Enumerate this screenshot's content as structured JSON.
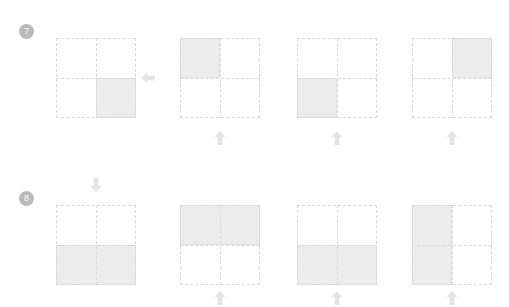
{
  "page": {
    "width": 509,
    "height": 307,
    "background": "#ffffff",
    "grid_line_color": "#d8d8d8",
    "fill_color": "#ececec",
    "arrow_color": "#e4e4e4",
    "badge_color": "#b9b9b9",
    "badge_text_color": "#ffffff"
  },
  "questions": [
    {
      "number": "7",
      "badge": {
        "label": "7",
        "x": 19,
        "y": 24
      },
      "prompt_grid": {
        "name": "question-7-prompt-grid",
        "x": 56,
        "y": 38,
        "size": 80,
        "rows": 2,
        "cols": 2,
        "shaded": [
          "bottom-right"
        ]
      },
      "prompt_arrow": {
        "name": "question-7-prompt-arrow",
        "direction": "left",
        "x": 139,
        "y": 69
      },
      "options": [
        {
          "label": "A",
          "grid": {
            "x": 180,
            "y": 38,
            "size": 80,
            "shaded": [
              "top-left"
            ]
          },
          "arrow": {
            "direction": "up",
            "x": 211,
            "y": 129
          }
        },
        {
          "label": "B",
          "grid": {
            "x": 297,
            "y": 38,
            "size": 80,
            "shaded": [
              "bottom-left"
            ]
          },
          "arrow": {
            "direction": "up",
            "x": 328,
            "y": 129
          }
        },
        {
          "label": "C",
          "grid": {
            "x": 412,
            "y": 38,
            "size": 80,
            "shaded": [
              "top-right"
            ]
          },
          "arrow": {
            "direction": "up",
            "x": 443,
            "y": 129
          }
        }
      ]
    },
    {
      "number": "8",
      "badge": {
        "label": "8",
        "x": 19,
        "y": 191
      },
      "prompt_grid": {
        "name": "question-8-prompt-grid",
        "x": 56,
        "y": 205,
        "size": 80,
        "rows": 2,
        "cols": 2,
        "shaded": [
          "bottom-half"
        ]
      },
      "prompt_arrow": {
        "name": "question-8-prompt-arrow",
        "direction": "down",
        "x": 87,
        "y": 176
      },
      "options": [
        {
          "label": "A",
          "grid": {
            "x": 180,
            "y": 205,
            "size": 80,
            "shaded": [
              "top-half"
            ]
          },
          "arrow": {
            "direction": "up",
            "x": 211,
            "y": 289
          }
        },
        {
          "label": "B",
          "grid": {
            "x": 297,
            "y": 205,
            "size": 80,
            "shaded": [
              "bottom-half"
            ]
          },
          "arrow": {
            "direction": "up",
            "x": 328,
            "y": 289
          }
        },
        {
          "label": "C",
          "grid": {
            "x": 412,
            "y": 205,
            "size": 80,
            "shaded": [
              "left-half"
            ]
          },
          "arrow": {
            "direction": "up",
            "x": 443,
            "y": 289
          }
        }
      ]
    }
  ]
}
